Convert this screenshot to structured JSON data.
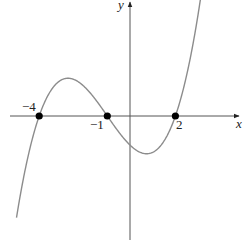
{
  "chart_data": {
    "type": "line",
    "title": "",
    "xlabel": "x",
    "ylabel": "y",
    "function": "y = a(x+4)(x+1)(x-2), a > 0",
    "roots": [
      -4,
      -1,
      2
    ],
    "root_labels": [
      "−4",
      "−1",
      "2"
    ],
    "marked_points": [
      {
        "x": -4,
        "y": 0,
        "label": "−4"
      },
      {
        "x": -1,
        "y": 0,
        "label": "−1"
      },
      {
        "x": 2,
        "y": 0,
        "label": "2"
      }
    ],
    "series": [
      {
        "name": "cubic curve",
        "color": "#8c8c8c",
        "x": [
          -5.0,
          -4.5,
          -4.0,
          -3.5,
          -3.0,
          -2.7,
          -2.5,
          -2.0,
          -1.5,
          -1.0,
          -0.5,
          0.0,
          0.5,
          0.7,
          1.0,
          1.5,
          2.0,
          2.5,
          3.0
        ],
        "y": [
          -5.76,
          -2.34,
          0.0,
          1.38,
          1.92,
          1.66,
          1.62,
          1.28,
          0.7,
          0.0,
          -0.63,
          -1.28,
          -1.62,
          -1.66,
          -1.6,
          -0.97,
          0.0,
          1.38,
          3.08
        ]
      }
    ],
    "y_intercept": -1.28,
    "local_max": {
      "x": -2.7,
      "y": 1.66
    },
    "local_min": {
      "x": 0.7,
      "y": -1.66
    },
    "xlim": [
      -5.3,
      4.8
    ],
    "ylim": [
      -5.6,
      5.1
    ],
    "grid": false,
    "legend": null,
    "axis_color": "#555555",
    "point_color": "#000000"
  }
}
